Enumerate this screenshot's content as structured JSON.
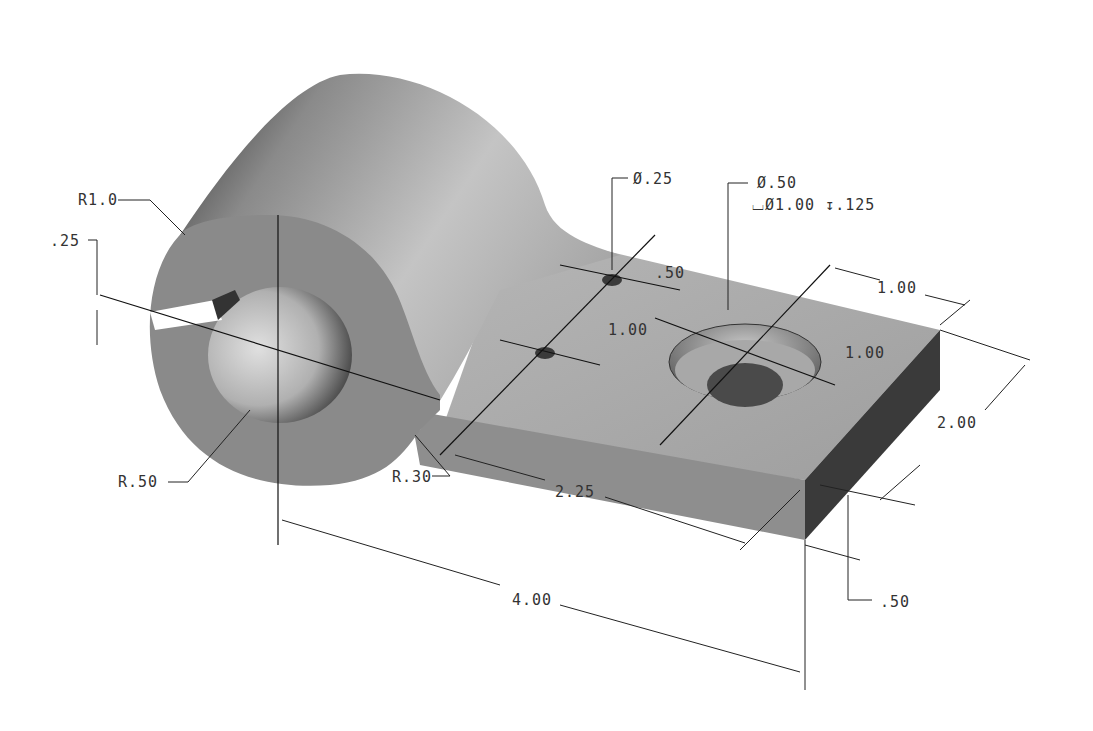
{
  "drawing": {
    "title": "Isometric part with dimensions",
    "colors": {
      "background": "#ffffff",
      "face_light": "#b8b8b8",
      "face_mid": "#8e8e8e",
      "face_dark": "#3a3a3a",
      "dimension": "#333333"
    },
    "dimensions": {
      "r_outer": "R1.0",
      "boss_slot": ".25",
      "r_bore": "R.50",
      "r_fillet": "R.30",
      "small_hole_dia": "Ø.25",
      "small_hole_spacing": ".50",
      "small_hole_offset": "1.00",
      "cbore_hole_dia": "Ø.50",
      "cbore_spec": "⌴Ø1.00 ↧.125",
      "cbore_from_end": "1.00",
      "cbore_from_edge": "1.00",
      "plate_width": "2.00",
      "plate_length_from_fillet": "2.25",
      "overall_length": "4.00",
      "plate_thickness": ".50"
    }
  }
}
